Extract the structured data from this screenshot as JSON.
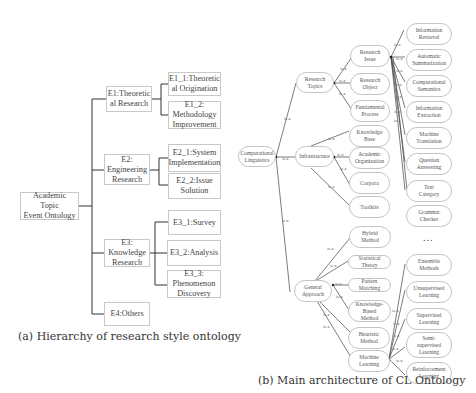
{
  "left_diagram": {
    "root": "Academic Topic\nEvent Ontology",
    "categories": [
      {
        "label": "E1:Theoretic\nal Research",
        "children": [
          "E1_1:Theoretic\nal Origination",
          "E1_2:\nMethodology\nImprovement"
        ]
      },
      {
        "label": "E2:\nEngineering\nResearch",
        "children": [
          "E2_1:System\nImplementation",
          "E2_2:Issue\nSolution"
        ]
      },
      {
        "label": "E3:\nKnowledge\nResearch",
        "children": [
          "E3_1:Survey",
          "E3_2:Analysis",
          "E3_3:\nPhenomenon\nDiscovery"
        ]
      },
      {
        "label": "E4:Others",
        "children": []
      }
    ],
    "caption": "(a) Hierarchy of research style ontology"
  },
  "right_diagram": {
    "root": "Computational\nLinguistics",
    "edge_label": "is-a",
    "level1": [
      "Research\nTopics",
      "Infrastructure",
      "General\nApproach"
    ],
    "research_topics_children": [
      "Research\nIssue",
      "Research\nObject",
      "Fundamental\nProcess"
    ],
    "infrastructure_children": [
      "Knowledge\nBase",
      "Academic\nOrganization",
      "Corpora",
      "Toolkits"
    ],
    "general_approach_children": [
      "Hybrid\nMethod",
      "Statistical Theory",
      "Pattern Matching",
      "Knowledge- Based\nMethod",
      "Heuristic\nMethod",
      "Machine\nLearning"
    ],
    "research_issue_children": [
      "Information\nRetrieval",
      "Automatic\nSummarization",
      "Computational\nSemantics",
      "Information\nExtraction",
      "Machine\nTranslation",
      "Question\nAnswering",
      "Text\nCategory",
      "Grammar\nChecker"
    ],
    "ellipsis": "...",
    "machine_learning_children": [
      "Ensemble\nMethods",
      "Unsupervised\nLearning",
      "Supervised\nLearning",
      "Semi-\nsupervised\nLearning",
      "Reinforcement\nLearning"
    ],
    "caption": "(b) Main architecture of CL Ontology"
  }
}
